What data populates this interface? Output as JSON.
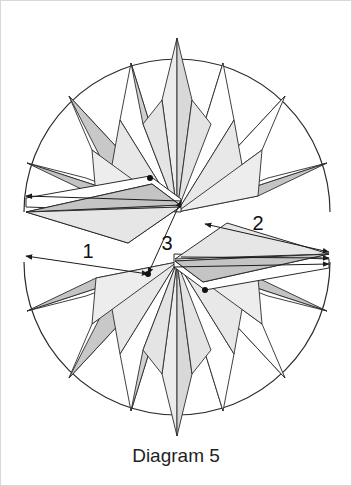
{
  "figure": {
    "caption": "Diagram 5",
    "background_color": "#ffffff",
    "stroke_color": "#2b2b2b",
    "border_color": "#d8d8d8",
    "fill_light": "#ececec",
    "fill_mid": "#d8d8d8",
    "fill_dark": "#c2c2c2",
    "fill_white": "#ffffff"
  },
  "dimensions": [
    {
      "id": "dim-1",
      "label": "1",
      "label_x": 88,
      "label_y": 258,
      "arrow": "double",
      "orientation": "horizontal-left"
    },
    {
      "id": "dim-2",
      "label": "2",
      "label_x": 258,
      "label_y": 230,
      "arrow": "double",
      "orientation": "horizontal-right"
    },
    {
      "id": "dim-3",
      "label": "3",
      "label_x": 167,
      "label_y": 248,
      "arrow": "double",
      "orientation": "diagonal-center"
    }
  ],
  "rosettes": [
    {
      "id": "rosette-top",
      "name": "upper-compass-rose",
      "center_x": 177,
      "center_y": 212,
      "radius": 153,
      "ray_count": 16,
      "orientation": "points-up"
    },
    {
      "id": "rosette-bottom",
      "name": "lower-compass-rose",
      "center_x": 177,
      "center_y": 262,
      "radius": 153,
      "ray_count": 16,
      "orientation": "points-down"
    }
  ],
  "markers": [
    {
      "id": "vertex-a",
      "x": 150,
      "y": 178
    },
    {
      "id": "vertex-b",
      "x": 181,
      "y": 201
    },
    {
      "id": "vertex-c",
      "x": 148,
      "y": 274
    },
    {
      "id": "vertex-d",
      "x": 181,
      "y": 257
    },
    {
      "id": "vertex-e",
      "x": 205,
      "y": 288
    }
  ],
  "caption_position": {
    "x": 176,
    "y": 462
  }
}
